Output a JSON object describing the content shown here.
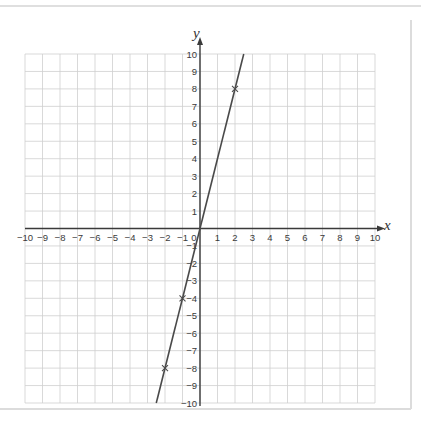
{
  "chart_data": {
    "type": "line",
    "title": "",
    "xlabel": "x",
    "ylabel": "y",
    "xlim": [
      -10,
      10
    ],
    "ylim": [
      -10,
      10
    ],
    "grid": true,
    "x_ticks": [
      -10,
      -9,
      -8,
      -7,
      -6,
      -5,
      -4,
      -3,
      -2,
      -1,
      0,
      1,
      2,
      3,
      4,
      5,
      6,
      7,
      8,
      9,
      10
    ],
    "y_ticks": [
      -10,
      -9,
      -8,
      -7,
      -6,
      -5,
      -4,
      -3,
      -2,
      -1,
      1,
      2,
      3,
      4,
      5,
      6,
      7,
      8,
      9,
      10
    ],
    "series": [
      {
        "name": "y = 4x",
        "equation": "y = 4x",
        "line_endpoints": [
          [
            -2.5,
            -10
          ],
          [
            2.5,
            10
          ]
        ],
        "plotted_points": [
          [
            -2,
            -8
          ],
          [
            -1,
            -4
          ],
          [
            2,
            8
          ]
        ],
        "marker": "cross",
        "color": "#4a4a4a"
      }
    ]
  },
  "labels": {
    "x_axis_name": "x",
    "y_axis_name": "y",
    "origin": "0"
  },
  "colors": {
    "grid": "#cfcfcf",
    "axis": "#3a3a3a",
    "line": "#4a4a4a",
    "frame": "#d8d8d8"
  }
}
